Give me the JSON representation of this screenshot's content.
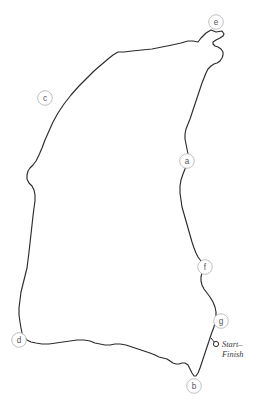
{
  "figure": {
    "kind": "circuit-map",
    "width": 263,
    "height": 410,
    "background_color": "#ffffff"
  },
  "track": {
    "name": "track-outline",
    "stroke_color": "#2b2b2b",
    "stroke_width": 1.15,
    "closed": true,
    "path": "M 222 31 L 216 32 L 211 30 L 206 33 L 201 38 L 198 42 L 193 41 L 188 41 L 181 43 L 172 45 L 162 47 L 152 49 L 142 50 L 132 51 L 124 52 L 118 52 L 113 55 L 108 59 L 101 65 L 94 71 L 87 78 L 79 86 L 71 95 L 64 104 L 58 113 L 53 122 L 49 131 L 45 140 L 42 148 L 39 155 L 36 161 L 33 165 L 30 168 L 28 171 L 27 175 L 27 179 L 29 183 L 32 186 L 34 190 L 35 195 L 35 201 L 34 208 L 33 216 L 32 225 L 31 234 L 30 243 L 29 252 L 28 260 L 27 268 L 25 276 L 23 284 L 21 292 L 20 300 L 19 308 L 19 315 L 20 322 L 21 328 L 22 333 L 24 337 L 27 340 L 31 342 L 36 343 L 42 344 L 49 344 L 56 343 L 63 342 L 70 341 L 77 340 L 84 340 L 90 341 L 95 343 L 100 344 L 105 345 L 110 345 L 115 344 L 120 344 L 126 345 L 132 347 L 138 349 L 144 351 L 150 353 L 155 355 L 159 357 L 163 358 L 167 359 L 170 361 L 173 363 L 176 364 L 179 364 L 182 363 L 185 363 L 188 365 L 190 369 L 192 373 L 194 376 L 196 376 L 198 373 L 200 368 L 202 362 L 204 356 L 206 350 L 208 344 L 210 338 L 212 332 L 214 327 L 215 322 L 216 317 L 216 312 L 215 307 L 213 302 L 210 297 L 207 293 L 204 289 L 202 285 L 201 281 L 201 277 L 202 273 L 204 270 L 206 267 L 204 264 L 201 261 L 198 257 L 196 253 L 194 248 L 192 242 L 190 235 L 188 228 L 186 221 L 184 214 L 182 207 L 181 200 L 180 193 L 180 186 L 181 180 L 183 174 L 185 169 L 187 164 L 188 159 L 188 154 L 187 149 L 186 144 L 185 139 L 185 134 L 186 129 L 188 124 L 190 119 L 192 113 L 194 107 L 196 101 L 198 95 L 200 89 L 202 83 L 204 78 L 206 73 L 208 69 L 211 66 L 214 64 L 217 63 L 220 61 L 222 58 L 223 55 L 223 52 L 221 49 L 218 47 L 215 46 L 213 44 L 213 42 L 216 40 L 220 38 L 223 36 L 224 34 Z"
  },
  "markers": [
    {
      "id": "marker-a",
      "label": "a",
      "cx": 187,
      "cy": 161,
      "r": 7.3
    },
    {
      "id": "marker-b",
      "label": "b",
      "cx": 194,
      "cy": 386,
      "r": 7.3
    },
    {
      "id": "marker-c",
      "label": "c",
      "cx": 45,
      "cy": 98,
      "r": 7.3
    },
    {
      "id": "marker-d",
      "label": "d",
      "cx": 19,
      "cy": 340,
      "r": 7.3
    },
    {
      "id": "marker-e",
      "label": "e",
      "cx": 216,
      "cy": 22,
      "r": 7.3
    },
    {
      "id": "marker-f",
      "label": "f",
      "cx": 205,
      "cy": 267,
      "r": 7.3
    },
    {
      "id": "marker-g",
      "label": "g",
      "cx": 221,
      "cy": 321,
      "r": 7.3
    }
  ],
  "start_finish": {
    "dot": {
      "cx": 216,
      "cy": 344,
      "r": 2.6
    },
    "tick": {
      "x1": 211,
      "y1": 338,
      "x2": 215,
      "y2": 343
    },
    "line1": "Start–",
    "line2": "Finish",
    "text_x": 222,
    "text_y1": 344,
    "text_y2": 354
  }
}
